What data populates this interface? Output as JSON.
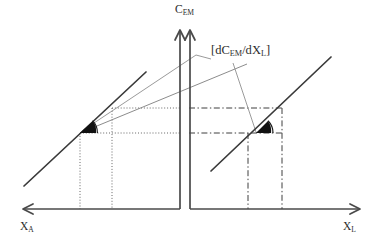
{
  "figure": {
    "type": "economics-schematic-diagram",
    "title": "",
    "background_color": "#ffffff",
    "width": 383,
    "height": 251
  },
  "axes": {
    "vertical": {
      "label_text": "C",
      "label_sub": "EM",
      "name": "C_EM",
      "description": "vertical axis with double line and two arrowheads (broken axis)",
      "color": "#4a4a4a",
      "x_left_line": 180,
      "x_right_line": 190,
      "top_y": 30,
      "bottom_y": 209
    },
    "horizontal_left": {
      "label_text": "X",
      "label_sub": "A",
      "name": "X_A",
      "direction": "left-pointing arrow",
      "color": "#4a4a4a",
      "y": 209,
      "x_start": 180,
      "x_end": 23
    },
    "horizontal_right": {
      "label_text": "X",
      "label_sub": "L",
      "name": "X_L",
      "direction": "right-pointing arrow",
      "color": "#4a4a4a",
      "y": 209,
      "x_start": 190,
      "x_end": 360
    }
  },
  "annotation": {
    "slope_label": {
      "prefix": "[d",
      "text_c": "C",
      "sub_em": "EM",
      "slash": "/d",
      "text_x": "X",
      "sub_l": "L",
      "suffix": "]",
      "full_text": "[dCEM/dXL]",
      "color": "#2b2b2b",
      "x": 211,
      "y": 44
    },
    "leader_lines": [
      {
        "name": "leader-to-left-vertex",
        "from": [
          211,
          59
        ],
        "to": [
          82,
          131
        ],
        "color": "#8c8c8c"
      },
      {
        "name": "leader-to-right-vertex",
        "from": [
          233,
          62
        ],
        "to": [
          256,
          131
        ],
        "color": "#8c8c8c"
      }
    ]
  },
  "curves": {
    "left_main_line": {
      "name": "left-budget-line",
      "description": "steep dark line in left (X_A) quadrant",
      "from": [
        24,
        186
      ],
      "to": [
        146,
        72
      ],
      "color": "#3a3a3a",
      "width": 1.6
    },
    "left_tangent_line": {
      "name": "left-tangent-ray",
      "description": "shallower light-gray ray from left vertex rising to the right across the axis",
      "from": [
        80,
        133
      ],
      "to": [
        246,
        64
      ],
      "color": "#8c8c8c",
      "width": 1.0
    },
    "right_main_line": {
      "name": "right-budget-line",
      "description": "dark line in right (X_L) quadrant",
      "from": [
        211,
        171
      ],
      "to": [
        331,
        57
      ],
      "color": "#3a3a3a",
      "width": 1.6
    }
  },
  "vertices": {
    "left": {
      "name": "left-tangency-point",
      "x": 80,
      "y": 133,
      "marker": "filled-black-wedge",
      "arc_radius": 16,
      "arc_color": "#1a1a1a"
    },
    "right": {
      "name": "right-tangency-point",
      "x": 256,
      "y": 133,
      "marker": "filled-black-wedge",
      "arc_radius": 16,
      "arc_color": "#1a1a1a"
    }
  },
  "guides": {
    "left_style": "dotted",
    "right_style": "dash-dot",
    "left_color": "#555555",
    "right_color": "#444444",
    "left_horizontal": [
      {
        "name": "left-horizontal-guide-lower",
        "y": 133,
        "x_from": 80,
        "x_to": 180
      },
      {
        "name": "left-horizontal-guide-upper",
        "y": 108,
        "x_from": 112,
        "x_to": 180
      }
    ],
    "left_vertical": [
      {
        "name": "left-vertical-guide-inner",
        "x": 80,
        "y_from": 133,
        "y_to": 209
      },
      {
        "name": "left-vertical-guide-outer",
        "x": 112,
        "y_from": 108,
        "y_to": 209
      }
    ],
    "right_horizontal": [
      {
        "name": "right-horizontal-guide-lower",
        "y": 133,
        "x_from": 190,
        "x_to": 282
      },
      {
        "name": "right-horizontal-guide-upper",
        "y": 108,
        "x_from": 190,
        "x_to": 282
      }
    ],
    "right_vertical": [
      {
        "name": "right-vertical-guide-inner",
        "x": 248,
        "y_from": 133,
        "y_to": 209
      },
      {
        "name": "right-vertical-guide-outer",
        "x": 282,
        "y_from": 108,
        "y_to": 209
      }
    ]
  }
}
